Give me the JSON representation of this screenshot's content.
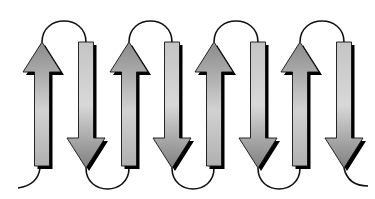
{
  "diagram": {
    "type": "antiparallel-beta-sheet",
    "strand_count": 8,
    "colors": {
      "fill_light": "#d4d4d4",
      "fill_dark": "#8a8a8a",
      "outline": "#111111",
      "shadow": "#000000",
      "loop": "#111111",
      "background": "#ffffff"
    },
    "strands": [
      {
        "direction": "up",
        "cx": 42
      },
      {
        "direction": "down",
        "cx": 86
      },
      {
        "direction": "up",
        "cx": 129
      },
      {
        "direction": "down",
        "cx": 172
      },
      {
        "direction": "up",
        "cx": 214
      },
      {
        "direction": "down",
        "cx": 258
      },
      {
        "direction": "up",
        "cx": 300
      },
      {
        "direction": "down",
        "cx": 344
      }
    ]
  }
}
